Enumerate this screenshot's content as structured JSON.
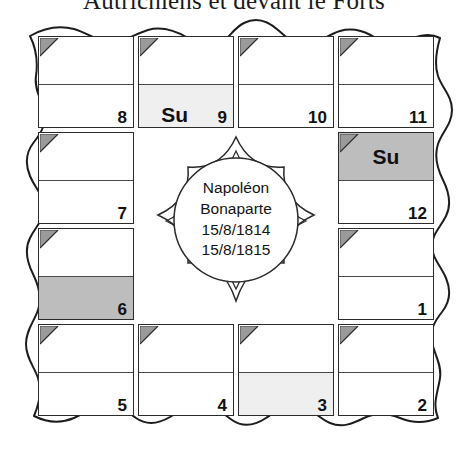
{
  "header": {
    "text": "Autrichiens et devant le Forts"
  },
  "medallion": {
    "line1": "Napoléon",
    "line2": "Bonaparte",
    "line3": "15/8/1814",
    "line4": "15/8/1815"
  },
  "colors": {
    "ink": "#2b2b2b",
    "shade_light": "#efefef",
    "shade_medium": "#bdbdbd",
    "corner_triangle": "#9a9a9a",
    "page": "#ffffff"
  },
  "calendar": {
    "sunday_label": "Su",
    "cells": [
      {
        "number": "8",
        "position": "top-1",
        "top_shade": "none",
        "bottom_shade": "none",
        "top_label": "",
        "bottom_label": ""
      },
      {
        "number": "9",
        "position": "top-2",
        "top_shade": "none",
        "bottom_shade": "light",
        "top_label": "",
        "bottom_label": "Su"
      },
      {
        "number": "10",
        "position": "top-3",
        "top_shade": "none",
        "bottom_shade": "none",
        "top_label": "",
        "bottom_label": ""
      },
      {
        "number": "11",
        "position": "top-4",
        "top_shade": "none",
        "bottom_shade": "none",
        "top_label": "",
        "bottom_label": ""
      },
      {
        "number": "12",
        "position": "right-1",
        "top_shade": "medium",
        "bottom_shade": "none",
        "top_label": "Su",
        "bottom_label": ""
      },
      {
        "number": "1",
        "position": "right-2",
        "top_shade": "none",
        "bottom_shade": "none",
        "top_label": "",
        "bottom_label": ""
      },
      {
        "number": "2",
        "position": "bottom-4",
        "top_shade": "none",
        "bottom_shade": "none",
        "top_label": "",
        "bottom_label": ""
      },
      {
        "number": "3",
        "position": "bottom-3",
        "top_shade": "none",
        "bottom_shade": "light",
        "top_label": "",
        "bottom_label": ""
      },
      {
        "number": "4",
        "position": "bottom-2",
        "top_shade": "none",
        "bottom_shade": "none",
        "top_label": "",
        "bottom_label": ""
      },
      {
        "number": "5",
        "position": "bottom-1",
        "top_shade": "none",
        "bottom_shade": "none",
        "top_label": "",
        "bottom_label": ""
      },
      {
        "number": "6",
        "position": "left-2",
        "top_shade": "none",
        "bottom_shade": "medium",
        "top_label": "",
        "bottom_label": ""
      },
      {
        "number": "7",
        "position": "left-1",
        "top_shade": "none",
        "bottom_shade": "none",
        "top_label": "",
        "bottom_label": ""
      }
    ]
  }
}
